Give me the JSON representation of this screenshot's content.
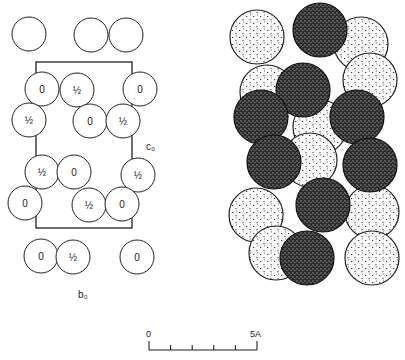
{
  "left_diagram": {
    "axis_labels": {
      "c": "c₀",
      "b": "b₀"
    },
    "radius": 17,
    "unit_cell": {
      "x": 36,
      "y": 62,
      "width": 96,
      "height": 166
    },
    "atoms": [
      {
        "x": 29,
        "y": 34,
        "label": ""
      },
      {
        "x": 91,
        "y": 35,
        "label": ""
      },
      {
        "x": 126,
        "y": 35,
        "label": ""
      },
      {
        "x": 42,
        "y": 89,
        "label": "0"
      },
      {
        "x": 77,
        "y": 90,
        "label": "½"
      },
      {
        "x": 140,
        "y": 89,
        "label": "0"
      },
      {
        "x": 29,
        "y": 120,
        "label": "½"
      },
      {
        "x": 90,
        "y": 121,
        "label": "0"
      },
      {
        "x": 123,
        "y": 121,
        "label": "½"
      },
      {
        "x": 42,
        "y": 172,
        "label": "½"
      },
      {
        "x": 74,
        "y": 172,
        "label": "0"
      },
      {
        "x": 138,
        "y": 175,
        "label": "½"
      },
      {
        "x": 25,
        "y": 203,
        "label": "0"
      },
      {
        "x": 89,
        "y": 205,
        "label": "½"
      },
      {
        "x": 122,
        "y": 204,
        "label": "0"
      },
      {
        "x": 41,
        "y": 256,
        "label": "0"
      },
      {
        "x": 73,
        "y": 257,
        "label": "½"
      },
      {
        "x": 137,
        "y": 257,
        "label": "0"
      }
    ]
  },
  "right_diagram": {
    "radius": 27,
    "light_atoms": [
      {
        "x": 257,
        "y": 37
      },
      {
        "x": 361,
        "y": 44
      },
      {
        "x": 267,
        "y": 92
      },
      {
        "x": 370,
        "y": 80
      },
      {
        "x": 320,
        "y": 127
      },
      {
        "x": 310,
        "y": 160
      },
      {
        "x": 256,
        "y": 215
      },
      {
        "x": 372,
        "y": 212
      },
      {
        "x": 276,
        "y": 253
      },
      {
        "x": 372,
        "y": 258
      }
    ],
    "dark_atoms": [
      {
        "x": 320,
        "y": 30
      },
      {
        "x": 303,
        "y": 90
      },
      {
        "x": 261,
        "y": 117
      },
      {
        "x": 357,
        "y": 117
      },
      {
        "x": 274,
        "y": 162
      },
      {
        "x": 370,
        "y": 165
      },
      {
        "x": 323,
        "y": 205
      },
      {
        "x": 307,
        "y": 258
      }
    ]
  },
  "scale_bar": {
    "start_label": "0",
    "end_label": "5A",
    "x0": 149,
    "x1": 257,
    "y": 350,
    "ticks": 6
  },
  "colors": {
    "line": "#222222",
    "light_fill": "#f4f4f4",
    "dark_fill": "#3a3a3a"
  }
}
